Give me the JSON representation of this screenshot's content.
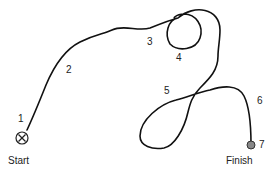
{
  "diagram": {
    "start_label": "Start",
    "finish_label": "Finish",
    "waypoints": [
      "1",
      "2",
      "3",
      "4",
      "5",
      "6",
      "7"
    ],
    "colors": {
      "path": "#111111",
      "text": "#222222",
      "finish_marker": "#888888"
    },
    "start_icon": "circled-x-icon",
    "finish_icon": "filled-circle-icon"
  }
}
